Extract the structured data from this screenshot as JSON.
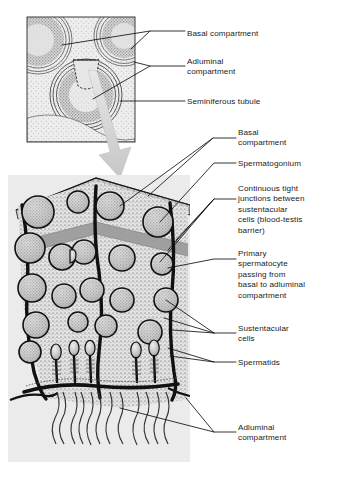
{
  "figure": {
    "title": "",
    "inset": {
      "name": "testis-cross-section-inset",
      "description": "Cross-section through seminiferous tubules",
      "labels": [
        {
          "id": "inset-basal",
          "text": "Basal compartment",
          "x": 187,
          "y": 33
        },
        {
          "id": "inset-adluminal",
          "text": "Adluminal\ncompartment",
          "x": 187,
          "y": 62
        },
        {
          "id": "inset-tubule",
          "text": "Seminiferous tubule",
          "x": 187,
          "y": 101
        }
      ]
    },
    "main": {
      "name": "seminiferous-epithelium-detail",
      "labels": [
        {
          "id": "main-basal",
          "text": "Basal\ncompartment",
          "x": 238,
          "y": 133
        },
        {
          "id": "main-spermatogonium",
          "text": "Spermatogonium",
          "x": 238,
          "y": 163
        },
        {
          "id": "main-tight-junctions",
          "text": "Continuous tight\njunctions between\nsustentacular\ncells (blood-testis\nbarrier)",
          "x": 238,
          "y": 189
        },
        {
          "id": "main-primary-spermatocyte",
          "text": "Primary\nspermatocyte\npassing from\nbasal to adluminal\ncompartment",
          "x": 238,
          "y": 254
        },
        {
          "id": "main-sustentacular",
          "text": "Sustentacular\ncells",
          "x": 238,
          "y": 328
        },
        {
          "id": "main-spermatids",
          "text": "Spermatids",
          "x": 238,
          "y": 362
        },
        {
          "id": "main-adluminal",
          "text": "Adluminal\ncompartment",
          "x": 238,
          "y": 427
        }
      ]
    },
    "colors": {
      "ink": "#1a1a1a",
      "panel_background": "#ebebeb",
      "cytoplasm": "#dcdcdc",
      "tight_junction_band": "#9a9a9a",
      "basement_membrane": "#b4b4b4",
      "callout_arrow": "#d2d2d2",
      "cell_fill": "#cfcfcf"
    }
  }
}
